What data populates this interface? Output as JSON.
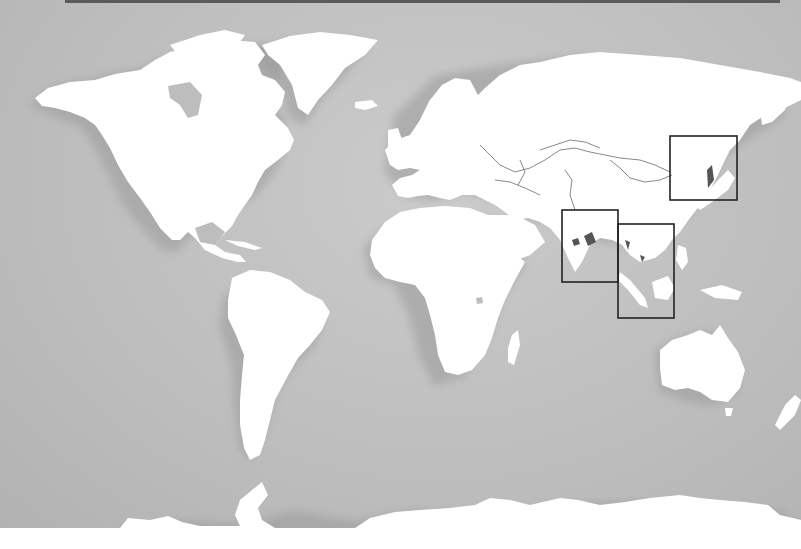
{
  "map": {
    "type": "world-map",
    "style": "white landmasses with drop shadow on gray ocean",
    "colors": {
      "ocean": "#bdbdbd",
      "land": "#ffffff",
      "borders": "#6a6a6a",
      "highlight_boxes": "#222222",
      "highlighted_areas": "#555555",
      "top_bar": "#5a5a5a"
    },
    "highlight_boxes": [
      {
        "id": "northeast-asia",
        "region": "Northeast China / Korea / Russian Far East"
      },
      {
        "id": "south-asia",
        "region": "India / Bangladesh"
      },
      {
        "id": "southeast-asia",
        "region": "Indochina / Malaysia / Indonesia"
      }
    ],
    "continents": [
      "North America",
      "Greenland",
      "South America",
      "Europe",
      "Africa",
      "Asia",
      "Australia",
      "Antarctica"
    ]
  }
}
